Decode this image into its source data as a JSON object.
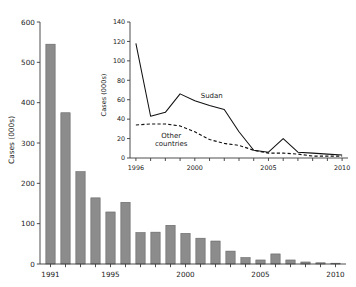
{
  "figure": {
    "background": "#ffffff",
    "bar_fill": "#8c8c8c",
    "bar_stroke": "#5f5f5f",
    "line_color": "#111111"
  },
  "main_axis": {
    "ylabel": "Cases (000s)",
    "y_ticks": [
      "0",
      "100",
      "200",
      "300",
      "400",
      "500",
      "600"
    ],
    "x_ticks": [
      "1991",
      "1995",
      "2000",
      "2005",
      "2010"
    ]
  },
  "inset_axis": {
    "ylabel": "Cases (000s)",
    "y_ticks": [
      "0",
      "20",
      "40",
      "60",
      "80",
      "100",
      "120",
      "140"
    ],
    "x_ticks": [
      "1996",
      "2000",
      "2005",
      "2010"
    ],
    "series_labels": {
      "sudan": "Sudan",
      "other": "Other\ncountries",
      "other_line1": "Other",
      "other_line2": "countries"
    }
  },
  "chart_data": [
    {
      "type": "bar",
      "name": "main-bar-chart",
      "title": "",
      "xlabel": "",
      "ylabel": "Cases (000s)",
      "categories": [
        1991,
        1992,
        1993,
        1994,
        1995,
        1996,
        1997,
        1998,
        1999,
        2000,
        2001,
        2002,
        2003,
        2004,
        2005,
        2006,
        2007,
        2008,
        2009,
        2010
      ],
      "values": [
        545,
        375,
        229,
        164,
        129,
        153,
        78,
        79,
        96,
        76,
        64,
        57,
        32,
        16,
        10,
        25,
        10,
        5,
        3,
        2
      ],
      "xlim": [
        1990.3,
        2010.7
      ],
      "ylim": [
        0,
        600
      ],
      "ytick_values": [
        0,
        100,
        200,
        300,
        400,
        500,
        600
      ],
      "xtick_values": [
        1991,
        1995,
        2000,
        2005,
        2010
      ],
      "grid": false,
      "legend": "none"
    },
    {
      "type": "line",
      "name": "inset-line-chart",
      "title": "",
      "xlabel": "",
      "ylabel": "Cases (000s)",
      "x": [
        1996,
        1997,
        1998,
        1999,
        2000,
        2001,
        2002,
        2003,
        2004,
        2005,
        2006,
        2007,
        2008,
        2009,
        2010
      ],
      "series": [
        {
          "name": "Sudan",
          "style": "solid",
          "values": [
            118,
            43,
            47,
            66,
            59,
            54,
            50,
            27,
            8,
            6,
            20,
            6,
            5,
            4,
            3
          ]
        },
        {
          "name": "Other countries",
          "style": "dashed",
          "values": [
            34,
            35,
            35,
            33,
            27,
            19,
            15,
            13,
            8,
            5,
            5,
            4,
            2,
            2,
            2
          ]
        }
      ],
      "xlim": [
        1995.6,
        2010.4
      ],
      "ylim": [
        0,
        140
      ],
      "ytick_values": [
        0,
        20,
        40,
        60,
        80,
        100,
        120,
        140
      ],
      "xtick_values": [
        1996,
        2000,
        2005,
        2010
      ],
      "grid": false,
      "legend": "inline-annotations",
      "annotations": [
        {
          "text": "Sudan",
          "x": 2000.4,
          "y": 62
        },
        {
          "text": "Other countries",
          "x": 1998.4,
          "y": 21
        }
      ]
    }
  ]
}
